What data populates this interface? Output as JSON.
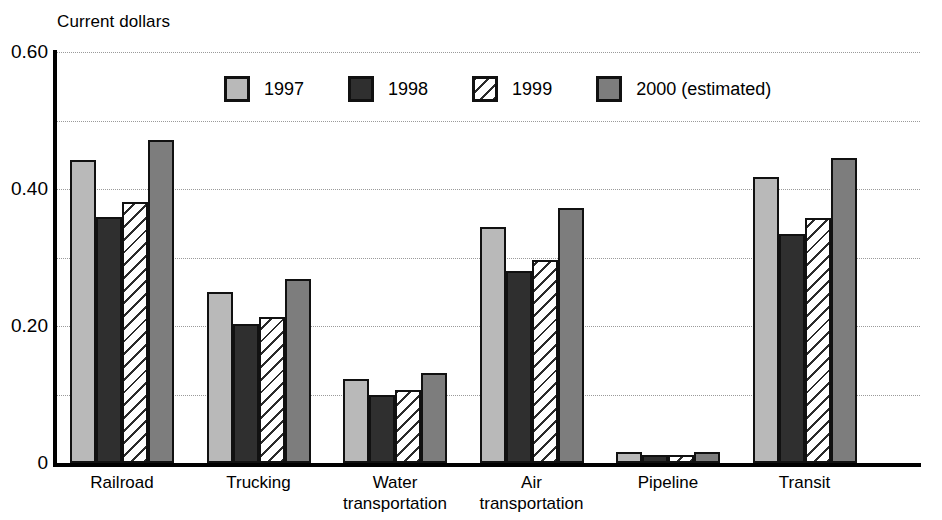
{
  "chart_data": {
    "type": "bar",
    "title": "",
    "subtitle": "",
    "ylabel": "Current dollars",
    "xlabel": "",
    "ylim": [
      0,
      0.6
    ],
    "yticks": [
      "0",
      "0.20",
      "0.40",
      "0.60"
    ],
    "ytick_values": [
      0,
      0.2,
      0.4,
      0.6
    ],
    "minor_gridlines": [
      0.1,
      0.3,
      0.5
    ],
    "grid": true,
    "legend_position": "top-center",
    "categories": [
      "Railroad",
      "Trucking",
      "Water\ntransportation",
      "Air\ntransportation",
      "Pipeline",
      "Transit"
    ],
    "series": [
      {
        "name": "1997",
        "color": "#b9b9b9",
        "values": [
          0.442,
          0.25,
          0.122,
          0.345,
          0.016,
          0.418
        ]
      },
      {
        "name": "1998",
        "color": "#2f2f2f",
        "values": [
          0.359,
          0.203,
          0.099,
          0.28,
          0.011,
          0.334
        ]
      },
      {
        "name": "1999",
        "color": "#ffffff",
        "values": [
          0.381,
          0.213,
          0.106,
          0.296,
          0.011,
          0.357
        ]
      },
      {
        "name": "2000 (estimated)",
        "color": "#7d7d7d",
        "values": [
          0.472,
          0.268,
          0.132,
          0.372,
          0.016,
          0.446
        ]
      }
    ]
  },
  "legend": {
    "items": [
      {
        "label": "1997"
      },
      {
        "label": "1998"
      },
      {
        "label": "1999"
      },
      {
        "label": "2000 (estimated)"
      }
    ]
  },
  "colors": {
    "series_1997": "#b9b9b9",
    "series_1998": "#2f2f2f",
    "series_1999": "#ffffff",
    "series_2000": "#7d7d7d",
    "axis": "#000000",
    "gridline": "#9a9a9a",
    "background": "#ffffff"
  }
}
